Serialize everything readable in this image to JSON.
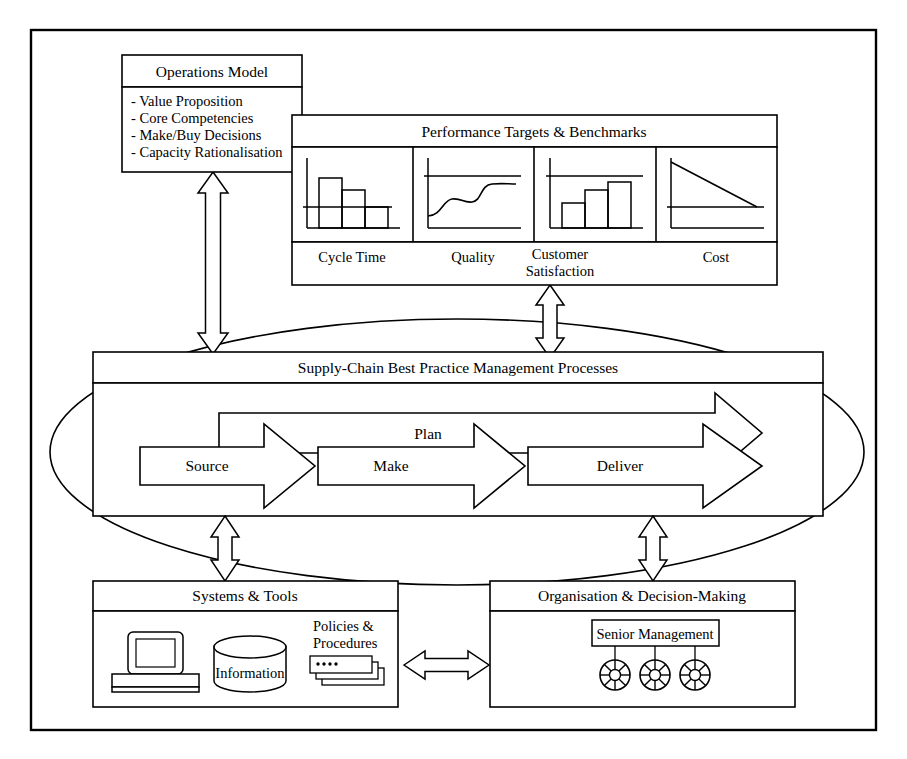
{
  "diagram": {
    "operations_model": {
      "title": "Operations Model",
      "items": [
        "- Value Proposition",
        "- Core Competencies",
        "- Make/Buy Decisions",
        "- Capacity Rationalisation"
      ]
    },
    "performance": {
      "title": "Performance Targets & Benchmarks",
      "cells": [
        {
          "label": "Cycle Time",
          "icon": "descending-bar-chart-icon"
        },
        {
          "label": "Quality",
          "icon": "s-curve-line-chart-icon"
        },
        {
          "label": "Customer\nSatisfaction",
          "label_line1": "Customer",
          "label_line2": "Satisfaction",
          "icon": "ascending-bar-chart-icon"
        },
        {
          "label": "Cost",
          "icon": "declining-line-chart-icon"
        }
      ]
    },
    "supply_chain": {
      "title": "Supply-Chain Best Practice Management Processes",
      "plan_arrow": "Plan",
      "process_arrows": [
        "Source",
        "Make",
        "Deliver"
      ]
    },
    "systems": {
      "title": "Systems & Tools",
      "computer_icon": "desktop-computer-icon",
      "database_label": "Information",
      "documents_label_line1": "Policies &",
      "documents_label_line2": "Procedures",
      "documents_icon": "stacked-documents-icon"
    },
    "organisation": {
      "title": "Organisation & Decision-Making",
      "senior_management": "Senior Management",
      "team_icon": "spoked-wheel-team-icon",
      "team_count": 3
    },
    "connectors": [
      {
        "name": "operations-to-supplychain",
        "type": "vertical-double-arrow"
      },
      {
        "name": "performance-to-supplychain",
        "type": "vertical-double-arrow"
      },
      {
        "name": "supplychain-to-systems",
        "type": "vertical-double-arrow"
      },
      {
        "name": "supplychain-to-organisation",
        "type": "vertical-double-arrow"
      },
      {
        "name": "systems-to-organisation",
        "type": "horizontal-double-arrow"
      }
    ]
  },
  "colors": {
    "stroke": "#000000",
    "fill": "#ffffff",
    "background": "#ffffff"
  }
}
